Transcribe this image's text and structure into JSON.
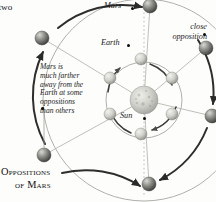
{
  "figure": {
    "kind": "orbital-diagram",
    "caption_line1": "Oppositions",
    "caption_line2": "of Mars",
    "background_color": "#fdfdfc",
    "ink_color": "#1a1a1a"
  },
  "left_text": {
    "line1": "ery two",
    "line2": "rbit",
    "line3": "ries",
    "line4": "7",
    "line5": "y."
  },
  "annotation": {
    "line1": "Mars is",
    "line2": "much farther",
    "line3": "away from the",
    "line4": "Earth at some",
    "line5": "oppositions",
    "line6": "than others"
  },
  "labels": {
    "mars": "Mars",
    "earth": "Earth",
    "close_opposition_line1": "close",
    "close_opposition_line2": "opposition",
    "sun": "Sun"
  },
  "bodies": {
    "sun": {
      "cx": 144,
      "cy": 100,
      "r": 14,
      "color": "#b9b9b4"
    },
    "earth_orbit": {
      "cx": 144,
      "cy": 100,
      "r": 38,
      "color": "#9a9a96"
    },
    "mars_orbit": {
      "cx": 144,
      "cy": 100,
      "r": 101,
      "color": "#9a9a96"
    },
    "earth_positions": [
      {
        "cx": 141,
        "cy": 59,
        "r": 6
      },
      {
        "cx": 172,
        "cy": 78,
        "r": 6
      },
      {
        "cx": 172,
        "cy": 114,
        "r": 6
      },
      {
        "cx": 141,
        "cy": 134,
        "r": 6
      },
      {
        "cx": 110,
        "cy": 114,
        "r": 6
      },
      {
        "cx": 110,
        "cy": 78,
        "r": 6
      }
    ],
    "mars_positions": [
      {
        "cx": 206,
        "cy": 48,
        "r": 7
      },
      {
        "cx": 212,
        "cy": 116,
        "r": 7
      },
      {
        "cx": 149,
        "cy": 184,
        "r": 7
      },
      {
        "cx": 44,
        "cy": 155,
        "r": 7
      },
      {
        "cx": 42,
        "cy": 38,
        "r": 7
      },
      {
        "cx": 150,
        "cy": 6,
        "r": 7
      }
    ]
  }
}
